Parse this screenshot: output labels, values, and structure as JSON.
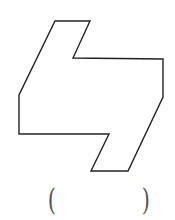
{
  "figure": {
    "shape": "hexagonal-polygon-composite",
    "stroke": "#222222",
    "fill": "#ffffff",
    "points": "55,21 90,21 73,58 163,59 163,97 128,171 91,171 109,134 19,134 19,95"
  },
  "answer_blank": {
    "left_paren": "(",
    "right_paren": ")",
    "value": ""
  }
}
